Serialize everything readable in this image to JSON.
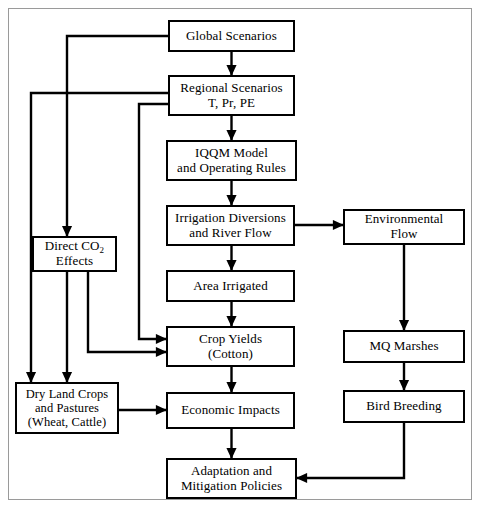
{
  "diagram": {
    "frame": {
      "border_color": "#9a9a9a"
    },
    "line_color": "#000000",
    "nodes": [
      {
        "id": "global-scenarios",
        "label": "Global Scenarios"
      },
      {
        "id": "regional-scenarios",
        "label": "Regional Scenarios\nT, Pr, PE"
      },
      {
        "id": "iqqm-model",
        "label": "IQQM Model\nand Operating Rules"
      },
      {
        "id": "irrigation-diversions",
        "label": "Irrigation Diversions\nand River Flow"
      },
      {
        "id": "area-irrigated",
        "label": "Area Irrigated"
      },
      {
        "id": "crop-yields",
        "label": "Crop Yields\n(Cotton)"
      },
      {
        "id": "economic-impacts",
        "label": "Economic Impacts"
      },
      {
        "id": "adaptation-policies",
        "label": "Adaptation and\nMitigation Policies"
      },
      {
        "id": "direct-co2-effects",
        "label_pre": "Direct CO",
        "label_sub": "2",
        "label_post": "\nEffects"
      },
      {
        "id": "dry-land-crops",
        "label": "Dry Land Crops\nand Pastures\n(Wheat, Cattle)"
      },
      {
        "id": "environmental-flow",
        "label": "Environmental\nFlow"
      },
      {
        "id": "mq-marshes",
        "label": "MQ Marshes"
      },
      {
        "id": "bird-breeding",
        "label": "Bird Breeding"
      }
    ],
    "edges": [
      {
        "from": "global-scenarios",
        "to": "regional-scenarios"
      },
      {
        "from": "global-scenarios",
        "to": "direct-co2-effects"
      },
      {
        "from": "regional-scenarios",
        "to": "iqqm-model"
      },
      {
        "from": "regional-scenarios",
        "to": "crop-yields"
      },
      {
        "from": "regional-scenarios",
        "to": "dry-land-crops"
      },
      {
        "from": "iqqm-model",
        "to": "irrigation-diversions"
      },
      {
        "from": "irrigation-diversions",
        "to": "area-irrigated"
      },
      {
        "from": "irrigation-diversions",
        "to": "environmental-flow"
      },
      {
        "from": "area-irrigated",
        "to": "crop-yields"
      },
      {
        "from": "direct-co2-effects",
        "to": "crop-yields"
      },
      {
        "from": "direct-co2-effects",
        "to": "dry-land-crops"
      },
      {
        "from": "crop-yields",
        "to": "economic-impacts"
      },
      {
        "from": "dry-land-crops",
        "to": "economic-impacts"
      },
      {
        "from": "economic-impacts",
        "to": "adaptation-policies"
      },
      {
        "from": "environmental-flow",
        "to": "mq-marshes"
      },
      {
        "from": "mq-marshes",
        "to": "bird-breeding"
      },
      {
        "from": "bird-breeding",
        "to": "adaptation-policies"
      }
    ]
  }
}
